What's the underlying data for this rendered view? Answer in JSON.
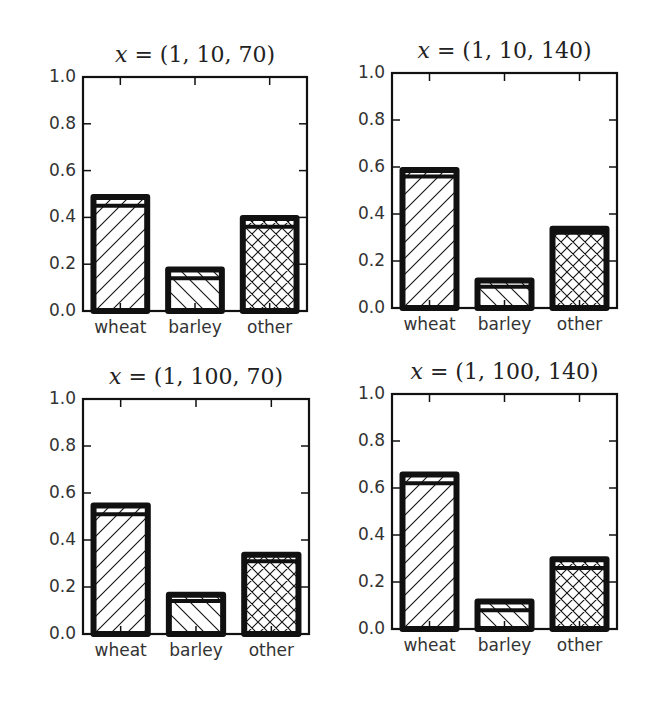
{
  "chart_data": [
    {
      "type": "bar",
      "title": "x = (1, 10, 70)",
      "title_var": "x",
      "title_rest": " = (1, 10, 70)",
      "categories": [
        "wheat",
        "barley",
        "other"
      ],
      "series": [
        {
          "name": "total (outer bar)",
          "values": [
            0.5,
            0.19,
            0.41
          ]
        },
        {
          "name": "inner segment",
          "values": [
            0.45,
            0.14,
            0.36
          ]
        }
      ],
      "hatches": [
        "//",
        "\\\\",
        "xx"
      ],
      "xlabel": "",
      "ylabel": "",
      "ylim": [
        0.0,
        1.0
      ],
      "yticks": [
        "0.0",
        "0.2",
        "0.4",
        "0.6",
        "0.8",
        "1.0"
      ],
      "grid": false
    },
    {
      "type": "bar",
      "title": "x = (1, 10, 140)",
      "title_var": "x",
      "title_rest": " = (1, 10, 140)",
      "categories": [
        "wheat",
        "barley",
        "other"
      ],
      "series": [
        {
          "name": "total (outer bar)",
          "values": [
            0.6,
            0.13,
            0.35
          ]
        },
        {
          "name": "inner segment",
          "values": [
            0.56,
            0.09,
            0.32
          ]
        }
      ],
      "hatches": [
        "//",
        "\\\\",
        "xx"
      ],
      "xlabel": "",
      "ylabel": "",
      "ylim": [
        0.0,
        1.0
      ],
      "yticks": [
        "0.0",
        "0.2",
        "0.4",
        "0.6",
        "0.8",
        "1.0"
      ],
      "grid": false
    },
    {
      "type": "bar",
      "title": "x = (1, 100, 70)",
      "title_var": "x",
      "title_rest": " = (1, 100, 70)",
      "categories": [
        "wheat",
        "barley",
        "other"
      ],
      "series": [
        {
          "name": "total (outer bar)",
          "values": [
            0.56,
            0.18,
            0.35
          ]
        },
        {
          "name": "inner segment",
          "values": [
            0.51,
            0.14,
            0.31
          ]
        }
      ],
      "hatches": [
        "//",
        "\\\\",
        "xx"
      ],
      "xlabel": "",
      "ylabel": "",
      "ylim": [
        0.0,
        1.0
      ],
      "yticks": [
        "0.0",
        "0.2",
        "0.4",
        "0.6",
        "0.8",
        "1.0"
      ],
      "grid": false
    },
    {
      "type": "bar",
      "title": "x = (1, 100, 140)",
      "title_var": "x",
      "title_rest": " = (1, 100, 140)",
      "categories": [
        "wheat",
        "barley",
        "other"
      ],
      "series": [
        {
          "name": "total (outer bar)",
          "values": [
            0.67,
            0.13,
            0.31
          ]
        },
        {
          "name": "inner segment",
          "values": [
            0.62,
            0.08,
            0.26
          ]
        }
      ],
      "hatches": [
        "//",
        "\\\\",
        "xx"
      ],
      "xlabel": "",
      "ylabel": "",
      "ylim": [
        0.0,
        1.0
      ],
      "yticks": [
        "0.0",
        "0.2",
        "0.4",
        "0.6",
        "0.8",
        "1.0"
      ],
      "grid": false
    }
  ],
  "colors": {
    "ink": "#111111",
    "text": "#333333",
    "background": "#ffffff"
  }
}
